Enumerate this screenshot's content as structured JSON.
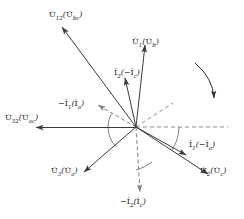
{
  "diagram": {
    "type": "phasor-diagram",
    "title": "",
    "origin": {
      "x": 136,
      "y": 127
    },
    "colors": {
      "solid_vector": "#3a3a3a",
      "dashed_vector": "#8a7f7f",
      "arc": "#4a4a4a",
      "label_text": "#1a1a1a",
      "background": "#ffffff"
    },
    "rotation_arrow": {
      "name": "clockwise-rotation-arrow",
      "direction": "clockwise",
      "start": {
        "x": 196,
        "y": 64
      },
      "end": {
        "x": 216,
        "y": 100
      }
    },
    "vectors": [
      {
        "id": "u12",
        "label": "U̇12(U̇bc)",
        "label_main": "U",
        "label_sub": "12",
        "label_paren_main": "U",
        "label_paren_sub": "bc",
        "style": "solid",
        "tip": {
          "x": 62,
          "y": 27
        },
        "label_pos": {
          "x": 56,
          "y": 12
        },
        "angle_deg": 126.5,
        "length_px": 125
      },
      {
        "id": "u1",
        "label": "U̇1(U̇b)",
        "label_main": "U",
        "label_sub": "1",
        "label_paren_main": "U",
        "label_paren_sub": "b",
        "style": "solid",
        "tip": {
          "x": 145,
          "y": 45
        },
        "label_pos": {
          "x": 131,
          "y": 39
        },
        "angle_deg": 83.7,
        "length_px": 82
      },
      {
        "id": "i2",
        "label": "İ2(−İc)",
        "label_main": "I",
        "label_sub": "2",
        "label_paren_main": "−I",
        "label_paren_sub": "c",
        "style": "solid",
        "tip": {
          "x": 125,
          "y": 78
        },
        "label_pos": {
          "x": 113,
          "y": 70
        },
        "angle_deg": 102.6,
        "length_px": 50
      },
      {
        "id": "u32",
        "label": "U̇32(U̇ac)",
        "label_main": "U",
        "label_sub": "32",
        "label_paren_main": "U",
        "label_paren_sub": "ac",
        "style": "solid",
        "tip": {
          "x": 36,
          "y": 128
        },
        "label_pos": {
          "x": 6,
          "y": 115
        },
        "angle_deg": 180,
        "length_px": 100
      },
      {
        "id": "u3",
        "label": "U̇3(U̇a)",
        "label_main": "U",
        "label_sub": "3",
        "label_paren_main": "U",
        "label_paren_sub": "a",
        "style": "solid",
        "tip": {
          "x": 84,
          "y": 172
        },
        "label_pos": {
          "x": 52,
          "y": 168
        },
        "angle_deg": 222,
        "length_px": 70
      },
      {
        "id": "i1",
        "label": "İ1(−İa)",
        "label_main": "I",
        "label_sub": "1",
        "label_paren_main": "−I",
        "label_paren_sub": "a",
        "style": "solid",
        "tip": {
          "x": 186,
          "y": 155
        },
        "label_pos": {
          "x": 188,
          "y": 142
        },
        "angle_deg": -29.2,
        "length_px": 57
      },
      {
        "id": "u2",
        "label": "U̇2(U̇c)",
        "label_main": "U",
        "label_sub": "2",
        "label_paren_main": "U",
        "label_paren_sub": "c",
        "style": "solid",
        "tip": {
          "x": 208,
          "y": 174
        },
        "label_pos": {
          "x": 199,
          "y": 168
        },
        "angle_deg": -33.3,
        "length_px": 86
      },
      {
        "id": "neg-i1",
        "label": "−İ1(İa)",
        "label_main": "−I",
        "label_sub": "1",
        "label_paren_main": "I",
        "label_paren_sub": "a",
        "style": "dashed",
        "tip": {
          "x": 98,
          "y": 105
        },
        "label_pos": {
          "x": 60,
          "y": 100
        },
        "angle_deg": 150.9,
        "length_px": 44
      },
      {
        "id": "neg-i2",
        "label": "−İ2(İc)",
        "label_main": "−I",
        "label_sub": "2",
        "label_paren_main": "I",
        "label_paren_sub": "c",
        "style": "dashed",
        "tip": {
          "x": 140,
          "y": 192
        },
        "label_pos": {
          "x": 122,
          "y": 197
        },
        "angle_deg": -86.5,
        "length_px": 65
      }
    ],
    "reference_lines": [
      {
        "id": "horizontal-reference",
        "name": "horizontal-reference-line",
        "style": "dashed",
        "from": {
          "x": 136,
          "y": 127
        },
        "to": {
          "x": 228,
          "y": 127
        }
      },
      {
        "id": "upper-right-reference",
        "name": "upper-right-reference-line",
        "style": "dashed",
        "from": {
          "x": 136,
          "y": 127
        },
        "to": {
          "x": 173,
          "y": 103
        }
      }
    ],
    "angle_arcs": [
      {
        "id": "arc-left-upper",
        "name": "phase-angle-arc-left"
      },
      {
        "id": "arc-left-lower",
        "name": "phase-angle-arc-lower-left"
      },
      {
        "id": "arc-right",
        "name": "phase-angle-arc-right"
      },
      {
        "id": "arc-bottom",
        "name": "phase-angle-arc-bottom"
      }
    ]
  }
}
